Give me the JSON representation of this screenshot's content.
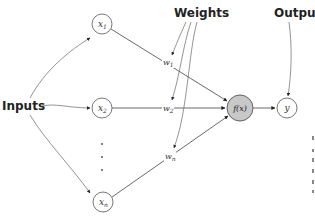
{
  "diagram": {
    "type": "neural-network-perceptron",
    "labels": {
      "inputs": "Inputs",
      "weights": "Weights",
      "output": "Output"
    },
    "input_nodes": [
      {
        "id": "x1",
        "var": "x",
        "sub": "1"
      },
      {
        "id": "x2",
        "var": "x",
        "sub": "2"
      },
      {
        "id": "xn",
        "var": "x",
        "sub": "n"
      }
    ],
    "ellipsis": "· · ·",
    "weights": [
      {
        "id": "w1",
        "var": "w",
        "sub": "1"
      },
      {
        "id": "w2",
        "var": "w",
        "sub": "2"
      },
      {
        "id": "wn",
        "var": "w",
        "sub": "n"
      }
    ],
    "function_node": {
      "label": "f(x)",
      "fill": "#c8c8c8"
    },
    "output_node": {
      "label": "y"
    },
    "colors": {
      "line": "#444444",
      "node_stroke": "#555555",
      "function_fill": "#c8c8c8"
    }
  }
}
